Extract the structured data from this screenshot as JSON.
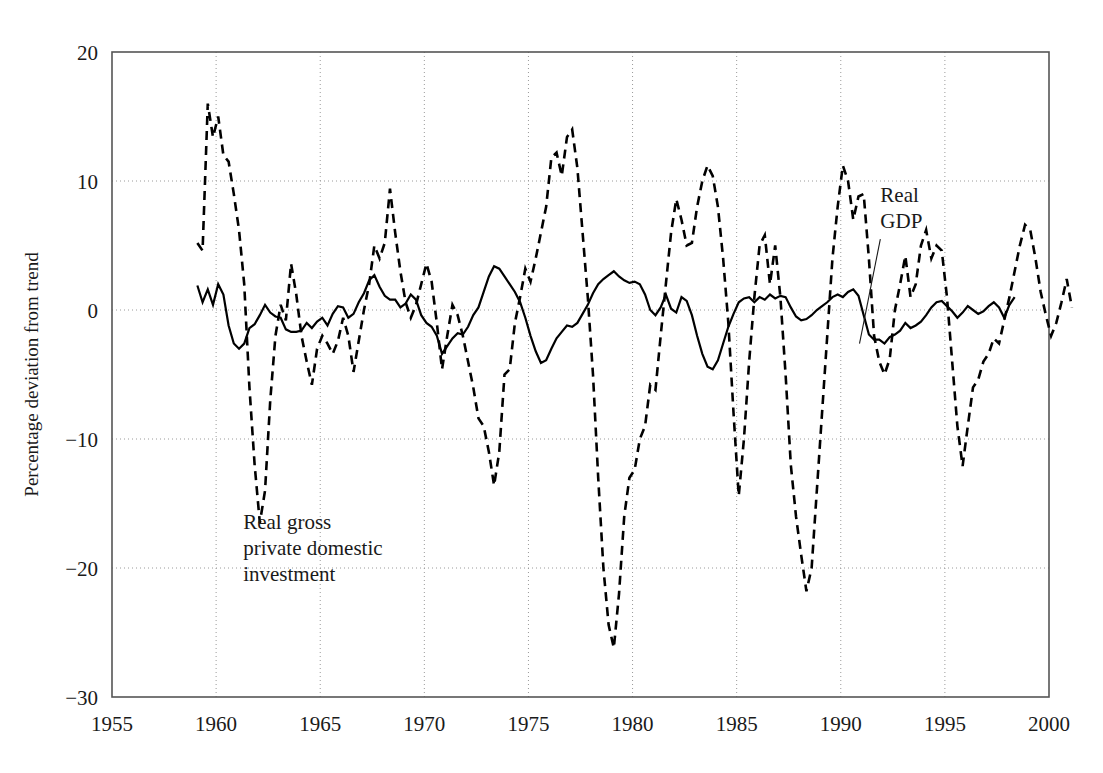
{
  "chart_data": {
    "type": "line",
    "title": "",
    "subtitle": "",
    "xlabel": "",
    "ylabel": "Percentage deviation from trend",
    "xlim": [
      1955,
      2000
    ],
    "ylim": [
      -30,
      20
    ],
    "grid": true,
    "grid_style": "dotted",
    "legend_position": "inline-annotations",
    "xticks": [
      1955,
      1960,
      1965,
      1970,
      1975,
      1980,
      1985,
      1990,
      1995,
      2000
    ],
    "xticklabels": [
      "1955",
      "1960",
      "1965",
      "1970",
      "1975",
      "1980",
      "1985",
      "1990",
      "1995",
      "2000"
    ],
    "yticks": [
      20,
      10,
      0,
      -10,
      -20,
      -30
    ],
    "yticklabels": [
      "20",
      "10",
      "0",
      "−10",
      "−20",
      "−30"
    ],
    "annotations": [
      {
        "text": "Real gross private domestic investment",
        "lines": [
          "Real gross",
          "private domestic",
          "investment"
        ],
        "x": 1961.3,
        "y": -17.0,
        "leader": false
      },
      {
        "text": "Real GDP",
        "lines": [
          "Real",
          "GDP"
        ],
        "x": 1991.9,
        "y": 8.4,
        "leader": true,
        "leader_from": [
          1991.9,
          5.5
        ],
        "leader_to": [
          1990.9,
          -2.6
        ]
      }
    ],
    "series": [
      {
        "name": "Real GDP",
        "style": "solid",
        "color": "#000000",
        "linewidth": 2.2,
        "x_start": 1959.1,
        "x_step": 0.25,
        "values": [
          1.9,
          0.6,
          1.6,
          0.4,
          2.0,
          1.2,
          -1.2,
          -2.6,
          -3.0,
          -2.6,
          -1.4,
          -1.1,
          -0.4,
          0.4,
          -0.2,
          -0.5,
          -0.6,
          -1.5,
          -1.7,
          -1.7,
          -1.6,
          -1.0,
          -1.4,
          -0.9,
          -0.6,
          -1.2,
          -0.3,
          0.3,
          0.2,
          -0.6,
          -0.3,
          0.6,
          1.3,
          2.3,
          2.7,
          1.8,
          1.1,
          0.8,
          0.8,
          0.2,
          0.5,
          1.2,
          0.8,
          -0.4,
          -1.0,
          -1.3,
          -2.0,
          -3.4,
          -2.8,
          -2.2,
          -1.8,
          -1.9,
          -1.3,
          -0.4,
          0.2,
          1.4,
          2.6,
          3.4,
          3.2,
          2.6,
          2.0,
          1.4,
          0.6,
          -0.6,
          -2.0,
          -3.2,
          -4.1,
          -3.9,
          -3.0,
          -2.2,
          -1.7,
          -1.2,
          -1.3,
          -1.0,
          -0.3,
          0.4,
          1.3,
          2.0,
          2.4,
          2.7,
          3.0,
          2.6,
          2.3,
          2.1,
          2.2,
          2.0,
          1.2,
          0.0,
          -0.4,
          0.2,
          1.2,
          0.1,
          -0.2,
          1.0,
          0.7,
          -0.4,
          -2.0,
          -3.4,
          -4.4,
          -4.6,
          -3.9,
          -2.6,
          -1.3,
          -0.3,
          0.6,
          0.9,
          1.0,
          0.6,
          1.0,
          0.8,
          1.2,
          0.9,
          1.1,
          1.0,
          0.2,
          -0.5,
          -0.8,
          -0.7,
          -0.4,
          0.0,
          0.3,
          0.6,
          1.0,
          1.2,
          1.0,
          1.4,
          1.6,
          1.1,
          -0.4,
          -1.9,
          -2.3,
          -2.3,
          -2.6,
          -2.1,
          -1.9,
          -1.6,
          -1.0,
          -1.4,
          -1.2,
          -0.9,
          -0.4,
          0.2,
          0.6,
          0.7,
          0.3,
          -0.1,
          -0.6,
          -0.2,
          0.3,
          0.0,
          -0.3,
          -0.1,
          0.3,
          0.6,
          0.2,
          -0.6,
          0.4,
          1.0
        ]
      },
      {
        "name": "Real gross private domestic investment",
        "style": "dashed",
        "color": "#000000",
        "linewidth": 2.6,
        "dash": "9,6",
        "x_start": 1959.1,
        "x_step": 0.25,
        "values": [
          5.2,
          4.6,
          16.0,
          13.4,
          15.0,
          12.0,
          11.5,
          9.0,
          6.2,
          2.0,
          -6.0,
          -12.0,
          -16.5,
          -14.0,
          -7.0,
          -2.0,
          0.4,
          -0.8,
          3.6,
          1.2,
          -2.0,
          -4.0,
          -5.8,
          -3.0,
          -2.0,
          -2.6,
          -3.4,
          -2.4,
          -0.6,
          -2.0,
          -4.8,
          -2.4,
          0.0,
          2.0,
          5.0,
          4.0,
          5.2,
          9.4,
          6.0,
          3.0,
          0.6,
          -0.6,
          0.4,
          2.0,
          3.6,
          2.2,
          -1.0,
          -4.6,
          -2.0,
          0.4,
          -0.4,
          -2.0,
          -4.0,
          -6.0,
          -8.4,
          -9.0,
          -11.0,
          -13.6,
          -11.0,
          -5.0,
          -4.6,
          -1.0,
          1.0,
          3.2,
          2.2,
          4.0,
          6.0,
          8.0,
          11.8,
          12.2,
          10.4,
          13.4,
          14.0,
          11.0,
          6.0,
          1.0,
          -5.0,
          -13.0,
          -20.0,
          -24.4,
          -26.2,
          -22.0,
          -16.0,
          -13.0,
          -12.4,
          -10.0,
          -9.0,
          -5.8,
          -6.2,
          -2.0,
          2.0,
          6.0,
          8.6,
          7.0,
          5.0,
          5.2,
          8.0,
          10.0,
          11.2,
          10.4,
          8.0,
          4.0,
          -1.0,
          -8.0,
          -14.4,
          -10.0,
          -4.0,
          1.0,
          5.0,
          5.8,
          2.0,
          5.0,
          1.0,
          -5.0,
          -12.0,
          -16.0,
          -19.0,
          -21.8,
          -20.0,
          -14.0,
          -8.0,
          -2.0,
          4.0,
          8.0,
          11.2,
          10.0,
          7.0,
          8.8,
          9.0,
          4.0,
          -2.0,
          -4.0,
          -5.0,
          -3.8,
          0.0,
          2.0,
          4.2,
          1.0,
          2.0,
          5.0,
          6.2,
          4.0,
          5.0,
          4.6,
          1.0,
          -4.0,
          -9.0,
          -12.1,
          -9.0,
          -6.0,
          -5.4,
          -4.0,
          -3.4,
          -2.2,
          -2.6,
          -0.8,
          1.0,
          3.0,
          5.0,
          6.6,
          6.2,
          4.0,
          1.4,
          -0.4,
          -2.0,
          -1.0,
          0.6,
          2.4,
          0.2
        ]
      }
    ]
  },
  "axes": {
    "frame_color": "#555555",
    "grid_color": "#9a9a9a",
    "axis_label": "Percentage deviation from trend"
  }
}
